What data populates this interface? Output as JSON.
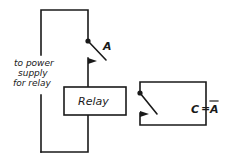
{
  "diagram": {
    "type": "relay-circuit",
    "power_note": [
      "to power",
      "supply",
      "for relay"
    ],
    "input_switch": {
      "label": "A",
      "state": "open"
    },
    "relay": {
      "label": "Relay"
    },
    "output_switch": {
      "state": "normally-closed"
    },
    "output_label": {
      "lhs": "C",
      "equals": "=",
      "rhs": "A",
      "rhs_overbar": true
    }
  },
  "colors": {
    "ink": "#1a1a1a",
    "background": "#ffffff"
  }
}
